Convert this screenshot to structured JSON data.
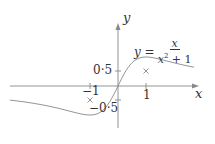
{
  "figure": {
    "equation": {
      "lhs": "y =",
      "numerator": "x",
      "denominator_base": "x",
      "denominator_exp": "2",
      "denominator_rest": " + 1"
    },
    "axes": {
      "x_label": "x",
      "y_label": "y"
    },
    "ticks": {
      "x_neg1": "−1",
      "x_pos1": "1",
      "y_pos": "0·5",
      "y_neg": "−0·5"
    },
    "colors": {
      "axis": "#888888",
      "curve": "#888888",
      "text": "#333333"
    }
  },
  "chart_data": {
    "type": "line",
    "function": "x/(x^2+1)",
    "xlabel": "x",
    "ylabel": "y",
    "x_ticks": [
      -1,
      1
    ],
    "y_ticks": [
      -0.5,
      0.5
    ],
    "marked_points": [
      {
        "x": -1,
        "y": -0.5,
        "marker": "cross"
      },
      {
        "x": 1,
        "y": 0.5,
        "marker": "cross"
      }
    ],
    "x": [
      -4,
      -3,
      -2,
      -1,
      -0.5,
      0,
      0.5,
      1,
      2,
      3
    ],
    "series": [
      {
        "name": "y = x/(x^2+1)",
        "values": [
          -0.235,
          -0.3,
          -0.4,
          -0.5,
          -0.4,
          0,
          0.4,
          0.5,
          0.4,
          0.3
        ]
      }
    ],
    "xlim": [
      -4,
      3
    ],
    "ylim": [
      -0.9,
      1.6
    ],
    "grid": false,
    "legend": "none"
  }
}
